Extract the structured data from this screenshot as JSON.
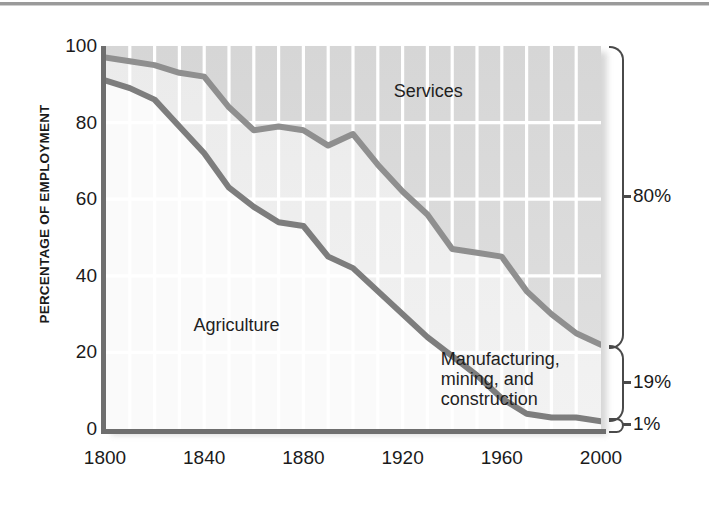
{
  "figure": {
    "y_axis_title": "PERCENTAGE OF EMPLOYMENT"
  },
  "chart_data": {
    "type": "area",
    "title": "",
    "subtitle": "",
    "xlabel": "",
    "ylabel": "PERCENTAGE OF EMPLOYMENT",
    "xlim": [
      1800,
      2000
    ],
    "ylim": [
      0,
      100
    ],
    "xticks": [
      1800,
      1840,
      1880,
      1920,
      1960,
      2000
    ],
    "xtick_labels": [
      "1800",
      "1840",
      "1880",
      "1920",
      "1960",
      "2000"
    ],
    "yticks": [
      0,
      20,
      40,
      60,
      80,
      100
    ],
    "ytick_labels": [
      "0",
      "20",
      "40",
      "60",
      "80",
      "100"
    ],
    "grid": "vertical white gridlines every 10 years; horizontal white gridlines at 20-unit intervals",
    "legend": "inline labels inside plot",
    "stacking": "cumulative from bottom: Manufacturing/mining/construction, then Agriculture boundary, then Services fills to 100",
    "series": [
      {
        "name": "Agriculture",
        "note": "lower boundary line; area below this line and above the manufacturing line is Agriculture",
        "x": [
          1800,
          1810,
          1820,
          1830,
          1840,
          1850,
          1860,
          1870,
          1880,
          1890,
          1900,
          1910,
          1920,
          1930,
          1940,
          1950,
          1960,
          1970,
          1980,
          1990,
          2000
        ],
        "values": [
          91,
          89,
          86,
          79,
          72,
          63,
          58,
          54,
          53,
          45,
          42,
          36,
          30,
          24,
          19,
          14,
          8,
          4,
          3,
          3,
          2
        ]
      },
      {
        "name": "Manufacturing, mining, and construction",
        "note": "upper boundary of the combined agriculture+manufacturing stack; area above this line is Services",
        "x": [
          1800,
          1810,
          1820,
          1830,
          1840,
          1850,
          1860,
          1870,
          1880,
          1890,
          1900,
          1910,
          1920,
          1930,
          1940,
          1950,
          1960,
          1970,
          1980,
          1990,
          2000
        ],
        "values": [
          97,
          96,
          95,
          93,
          92,
          84,
          78,
          79,
          78,
          74,
          77,
          69,
          62,
          56,
          47,
          46,
          45,
          36,
          30,
          25,
          22
        ]
      }
    ],
    "annotations": [
      {
        "text": "Services",
        "x": 1935,
        "y": 88
      },
      {
        "text": "Agriculture",
        "x": 1855,
        "y": 27
      },
      {
        "text": "Manufacturing, mining, and construction",
        "x": 1962,
        "y": 18
      }
    ],
    "right_brackets": [
      {
        "label": "80%",
        "from": 22,
        "to": 100,
        "meaning": "Services share in 2000"
      },
      {
        "label": "19%",
        "from": 3,
        "to": 22,
        "meaning": "Manufacturing, mining, and construction share in 2000"
      },
      {
        "label": "1%",
        "from": 0,
        "to": 3,
        "meaning": "Agriculture share in 2000"
      }
    ]
  },
  "labels": {
    "services": "Services",
    "agriculture": "Agriculture",
    "manufacturing_line1": "Manufacturing,",
    "manufacturing_line2": "mining, and",
    "manufacturing_line3": "construction"
  },
  "y_ticks": [
    {
      "value": 100,
      "label": "100"
    },
    {
      "value": 80,
      "label": "80"
    },
    {
      "value": 60,
      "label": "60"
    },
    {
      "value": 40,
      "label": "40"
    },
    {
      "value": 20,
      "label": "20"
    },
    {
      "value": 0,
      "label": "0"
    }
  ],
  "x_ticks": [
    {
      "value": 1800,
      "label": "1800"
    },
    {
      "value": 1840,
      "label": "1840"
    },
    {
      "value": 1880,
      "label": "1880"
    },
    {
      "value": 1920,
      "label": "1920"
    },
    {
      "value": 1960,
      "label": "1960"
    },
    {
      "value": 2000,
      "label": "2000"
    }
  ],
  "brackets": [
    {
      "label": "80%"
    },
    {
      "label": "19%"
    },
    {
      "label": "1%"
    }
  ],
  "colors": {
    "services_band": "#dadada",
    "manufacturing_band": "#ededed",
    "agriculture_band": "#fafafa",
    "line": "#8c8c8c",
    "line_dark": "#7a7a7a",
    "axis": "#6e6e6e",
    "gridline": "#ffffff",
    "text": "#1a1a1a"
  }
}
